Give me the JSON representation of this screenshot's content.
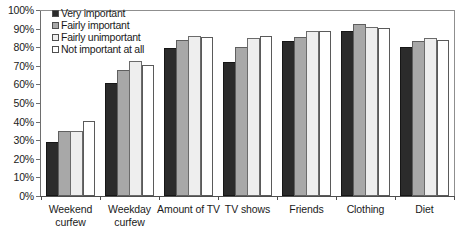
{
  "chart_data": {
    "type": "bar",
    "title": "",
    "subtitle": "",
    "xlabel": "",
    "ylabel": "",
    "ylim": [
      0,
      100
    ],
    "y_ticks": [
      "0%",
      "10%",
      "20%",
      "30%",
      "40%",
      "50%",
      "60%",
      "70%",
      "80%",
      "90%",
      "100%"
    ],
    "y_tick_values": [
      0,
      10,
      20,
      30,
      40,
      50,
      60,
      70,
      80,
      90,
      100
    ],
    "grid": false,
    "legend_position": "top-left inside plot",
    "categories": [
      "Weekend curfew",
      "Weekday curfew",
      "Amount of TV",
      "TV shows",
      "Friends",
      "Clothing",
      "Diet"
    ],
    "category_lines": [
      [
        "Weekend",
        "curfew"
      ],
      [
        "Weekday",
        "curfew"
      ],
      [
        "Amount of TV",
        ""
      ],
      [
        "TV shows",
        ""
      ],
      [
        "Friends",
        ""
      ],
      [
        "Clothing",
        ""
      ],
      [
        "Diet",
        ""
      ]
    ],
    "series": [
      {
        "name": "Very important",
        "color": "#2b2b2b",
        "values": [
          29,
          61,
          79.5,
          72,
          83.5,
          88.5,
          80
        ]
      },
      {
        "name": "Fairly important",
        "color": "#a8a8a8",
        "values": [
          35,
          68,
          84,
          80,
          85.5,
          92.5,
          83.5
        ]
      },
      {
        "name": "Fairly unimportant",
        "color": "#eeeeee",
        "values": [
          35,
          72.5,
          86,
          85,
          88.5,
          91,
          85
        ]
      },
      {
        "name": "Not important at all",
        "color": "#ffffff",
        "values": [
          40.5,
          70.5,
          85.5,
          86,
          88.5,
          90.5,
          84
        ]
      }
    ]
  },
  "axis": {
    "y_line_color": "#6e6e6e",
    "x_line_color": "#4d4d4d",
    "frame_color": "#8f8f8f"
  }
}
